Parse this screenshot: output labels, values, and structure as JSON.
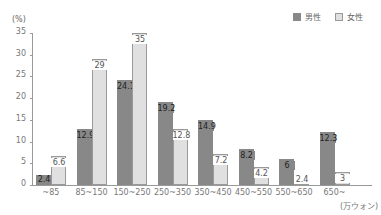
{
  "chart_data": {
    "type": "bar",
    "title": "",
    "xlabel": "(万ウォン)",
    "ylabel": "(%)",
    "ylim": [
      0,
      35
    ],
    "yticks": [
      0,
      5,
      10,
      15,
      20,
      25,
      30,
      35
    ],
    "categories": [
      "~85",
      "85~150",
      "150~250",
      "250~350",
      "350~450",
      "450~550",
      "550~650",
      "650~"
    ],
    "series": [
      {
        "name": "男性",
        "values": [
          2.4,
          12.9,
          24.1,
          19.2,
          14.9,
          8.2,
          6,
          12.3
        ],
        "color": "#888888"
      },
      {
        "name": "女性",
        "values": [
          6.6,
          29,
          35,
          12.8,
          7.2,
          4.2,
          2.4,
          3
        ],
        "color": "#ffffff"
      }
    ],
    "legend_position": "top-right",
    "grid": false
  },
  "legend": {
    "male": "男性",
    "female": "女性"
  },
  "axis": {
    "y_unit": "(%)",
    "x_unit": "(万ウォン)"
  }
}
